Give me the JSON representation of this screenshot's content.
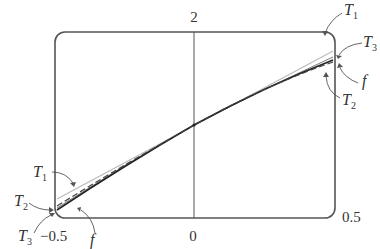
{
  "figure": {
    "axis_labels": {
      "y_top": "2",
      "x_center": "0",
      "x_left": "−0.5",
      "x_right": "0.5"
    },
    "curve_labels": {
      "top_right": [
        {
          "name": "T",
          "sub": "1"
        },
        {
          "name": "T",
          "sub": "3"
        },
        {
          "name": "f",
          "sub": ""
        },
        {
          "name": "T",
          "sub": "2"
        }
      ],
      "bottom_left": [
        {
          "name": "T",
          "sub": "1"
        },
        {
          "name": "T",
          "sub": "2"
        },
        {
          "name": "T",
          "sub": "3"
        },
        {
          "name": "f",
          "sub": ""
        }
      ]
    },
    "curves": [
      {
        "id": "T1",
        "style": "light solid",
        "color": "#b8b8b8"
      },
      {
        "id": "T2",
        "style": "dashed",
        "color": "#555555"
      },
      {
        "id": "T3",
        "style": "solid thin",
        "color": "#777777"
      },
      {
        "id": "f",
        "style": "solid",
        "color": "#222222"
      }
    ],
    "colors": {
      "frame": "#555555",
      "axis": "#555555",
      "text": "#333333"
    }
  }
}
